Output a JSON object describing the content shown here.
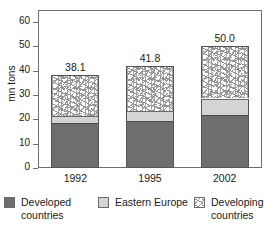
{
  "chart_data": {
    "type": "bar",
    "subtype": "stacked-vertical",
    "title": "",
    "xlabel": "",
    "ylabel": "mn tons",
    "ylim": [
      0,
      65
    ],
    "yticks": [
      0,
      10,
      20,
      30,
      40,
      50,
      60
    ],
    "ytick_labels": [
      "0",
      "10",
      "20",
      "30",
      "40",
      "50",
      "60"
    ],
    "grid": false,
    "legend_position": "bottom",
    "categories": [
      "1992",
      "1995",
      "2002"
    ],
    "series": [
      {
        "name": "Developed countries",
        "values": [
          18.5,
          19.5,
          22.0
        ],
        "color": "#6e6e6e"
      },
      {
        "name": "Eastern Europe",
        "values": [
          3.0,
          3.8,
          6.6
        ],
        "color": "#d4d4d4"
      },
      {
        "name": "Developing countries",
        "values": [
          16.6,
          18.5,
          21.4
        ],
        "color": "#ffffff"
      }
    ],
    "totals": [
      38.1,
      41.8,
      50.0
    ],
    "total_labels": [
      "38.1",
      "41.8",
      "50.0"
    ]
  },
  "axis": {
    "y_title": "mn tons"
  },
  "legend": {
    "items": [
      {
        "label_line1": "Developed",
        "label_line2": "countries",
        "swatch": "dark-gray-swatch-icon"
      },
      {
        "label_line1": "Eastern Europe",
        "label_line2": "",
        "swatch": "light-gray-swatch-icon"
      },
      {
        "label_line1": "Developing",
        "label_line2": "countries",
        "swatch": "speckled-swatch-icon"
      }
    ]
  }
}
